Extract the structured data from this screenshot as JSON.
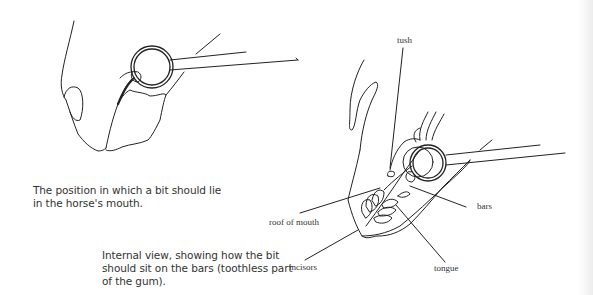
{
  "figures": [
    {
      "name": "external-view",
      "caption": "The position in which a bit should lie in the horse's mouth."
    },
    {
      "name": "internal-view",
      "caption": "Internal view, showing how the bit should sit on the bars (toothless part of the gum).",
      "labels": {
        "tush": "tush",
        "roof_of_mouth": "roof of mouth",
        "incisors": "incisors",
        "bars": "bars",
        "tongue": "tongue"
      }
    }
  ]
}
